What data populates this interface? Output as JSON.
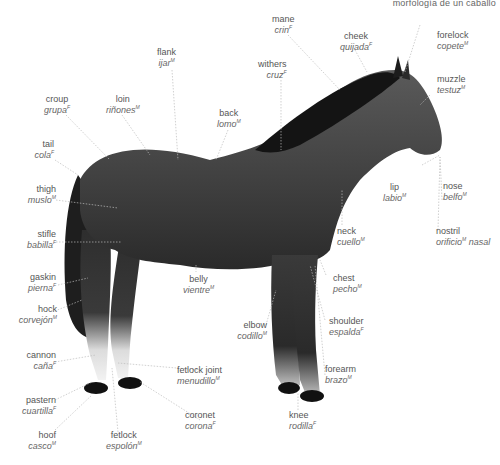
{
  "header": {
    "title": "morfología de un caballo"
  },
  "diagram": {
    "labels": [
      {
        "id": "mane",
        "en": "mane",
        "es": "crin",
        "g": "F"
      },
      {
        "id": "cheek",
        "en": "cheek",
        "es": "quijada",
        "g": "F"
      },
      {
        "id": "forelock",
        "en": "forelock",
        "es": "copete",
        "g": "M"
      },
      {
        "id": "flank",
        "en": "flank",
        "es": "ijar",
        "g": "M"
      },
      {
        "id": "withers",
        "en": "withers",
        "es": "cruz",
        "g": "F"
      },
      {
        "id": "muzzle",
        "en": "muzzle",
        "es": "testuz",
        "g": "M"
      },
      {
        "id": "croup",
        "en": "croup",
        "es": "grupa",
        "g": "F"
      },
      {
        "id": "loin",
        "en": "loin",
        "es": "riñones",
        "g": "M"
      },
      {
        "id": "back",
        "en": "back",
        "es": "lomo",
        "g": "M"
      },
      {
        "id": "tail",
        "en": "tail",
        "es": "cola",
        "g": "F"
      },
      {
        "id": "thigh",
        "en": "thigh",
        "es": "muslo",
        "g": "M"
      },
      {
        "id": "lip",
        "en": "lip",
        "es": "labio",
        "g": "M"
      },
      {
        "id": "nose",
        "en": "nose",
        "es": "belfo",
        "g": "M"
      },
      {
        "id": "stifle",
        "en": "stifle",
        "es": "babilla",
        "g": "F"
      },
      {
        "id": "neck",
        "en": "neck",
        "es": "cuello",
        "g": "M"
      },
      {
        "id": "nostril",
        "en": "nostril",
        "es": "orificio",
        "g": "M",
        "es_suffix": "nasal"
      },
      {
        "id": "gaskin",
        "en": "gaskin",
        "es": "pierna",
        "g": "F"
      },
      {
        "id": "belly",
        "en": "belly",
        "es": "vientre",
        "g": "M"
      },
      {
        "id": "chest",
        "en": "chest",
        "es": "pecho",
        "g": "M"
      },
      {
        "id": "hock",
        "en": "hock",
        "es": "corvejón",
        "g": "M"
      },
      {
        "id": "elbow",
        "en": "elbow",
        "es": "codillo",
        "g": "M"
      },
      {
        "id": "shoulder",
        "en": "shoulder",
        "es": "espalda",
        "g": "F"
      },
      {
        "id": "cannon",
        "en": "cannon",
        "es": "caña",
        "g": "F"
      },
      {
        "id": "fetlock_joint",
        "en": "fetlock joint",
        "es": "menudillo",
        "g": "M"
      },
      {
        "id": "forearm",
        "en": "forearm",
        "es": "brazo",
        "g": "M"
      },
      {
        "id": "pastern",
        "en": "pastern",
        "es": "cuartilla",
        "g": "F"
      },
      {
        "id": "coronet",
        "en": "coronet",
        "es": "corona",
        "g": "F"
      },
      {
        "id": "hoof",
        "en": "hoof",
        "es": "casco",
        "g": "M"
      },
      {
        "id": "fetlock",
        "en": "fetlock",
        "es": "espolón",
        "g": "M"
      },
      {
        "id": "knee",
        "en": "knee",
        "es": "rodilla",
        "g": "F"
      }
    ]
  }
}
